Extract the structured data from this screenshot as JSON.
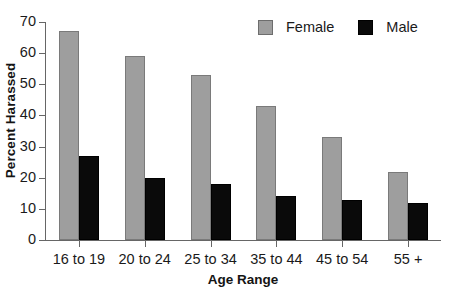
{
  "chart_data": {
    "type": "bar",
    "title": "",
    "xlabel": "Age Range",
    "ylabel": "Percent Harassed",
    "categories": [
      "16 to 19",
      "20 to 24",
      "25 to 34",
      "35 to 44",
      "45 to 54",
      "55 +"
    ],
    "series": [
      {
        "name": "Female",
        "color": "#9e9e9e",
        "values": [
          67,
          59,
          53,
          43,
          33,
          22
        ]
      },
      {
        "name": "Male",
        "color": "#0a0a0a",
        "values": [
          27,
          20,
          18,
          14,
          13,
          12
        ]
      }
    ],
    "ylim": [
      0,
      70
    ],
    "ytick_labels": [
      "0",
      "10",
      "20",
      "30",
      "40",
      "50",
      "60",
      "70"
    ],
    "ytick_values": [
      0,
      10,
      20,
      30,
      40,
      50,
      60,
      70
    ],
    "grid": false,
    "legend_position": "top-right"
  },
  "legend": {
    "entries": [
      {
        "label": "Female",
        "swatch": "#9e9e9e"
      },
      {
        "label": "Male",
        "swatch": "#0a0a0a"
      }
    ]
  },
  "axes": {
    "y_title": "Percent Harassed",
    "x_title": "Age Range"
  }
}
